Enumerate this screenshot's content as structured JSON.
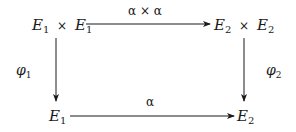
{
  "diagram": {
    "type": "commutative-diagram",
    "nodes": {
      "top_left": {
        "base1": "E",
        "sub1": "1",
        "op": "×",
        "base2": "E",
        "sub2": "1"
      },
      "top_right": {
        "base1": "E",
        "sub1": "2",
        "op": "×",
        "base2": "E",
        "sub2": "2"
      },
      "bottom_left": {
        "base": "E",
        "sub": "1"
      },
      "bottom_right": {
        "base": "E",
        "sub": "2"
      }
    },
    "arrows": {
      "top": {
        "label": "α × α"
      },
      "bottom": {
        "label": "α"
      },
      "left": {
        "label_base": "φ",
        "label_sub": "1"
      },
      "right": {
        "label_base": "φ",
        "label_sub": "2"
      }
    },
    "colors": {
      "ink": "#1a1a1a",
      "background": "#ffffff"
    }
  }
}
